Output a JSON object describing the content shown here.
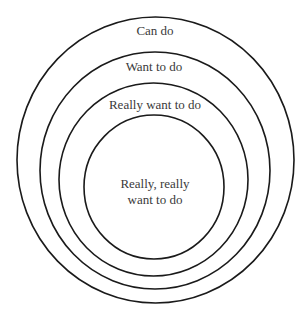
{
  "diagram": {
    "type": "nested-circles",
    "stroke_color": "#1a1a1a",
    "text_color": "#3a3a3a",
    "circles": [
      {
        "label": "Can do",
        "cx": 155.5,
        "cy": 160,
        "rx": 138.5,
        "ry": 143,
        "label_y": 35
      },
      {
        "label": "Want to do",
        "cx": 155,
        "cy": 170.5,
        "rx": 115,
        "ry": 118.5,
        "label_y": 71
      },
      {
        "label": "Really want to do",
        "cx": 153.5,
        "cy": 179.5,
        "rx": 94.5,
        "ry": 96.5,
        "label_y": 109
      },
      {
        "label_line1": "Really, really",
        "label_line2": "want to do",
        "cx": 154,
        "cy": 187,
        "rx": 70,
        "ry": 72,
        "label_y": 188
      }
    ]
  }
}
